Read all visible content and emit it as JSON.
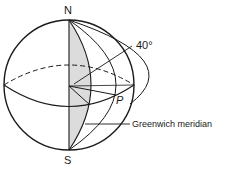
{
  "diagram": {
    "type": "globe-latitude-longitude",
    "labels": {
      "north": "N",
      "south": "S",
      "point": "P",
      "angle": "40°",
      "meridian": "Greenwich meridian"
    },
    "colors": {
      "stroke": "#1a1a1a",
      "shade": "#dcdcdc",
      "background": "#ffffff"
    }
  }
}
